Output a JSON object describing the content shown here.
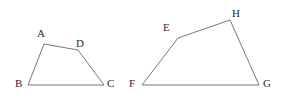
{
  "figure": {
    "background_color": "#ffffff",
    "stroke_color": "#555555",
    "label_color": "#2b2b2b",
    "stroke_width": 0.8,
    "width": 286,
    "height": 104,
    "shapes": [
      {
        "name": "quadrilateral-abcd",
        "vertex_order": "A-D-C-B",
        "closed": true,
        "points": [
          {
            "label": "A",
            "x": 44,
            "y": 44,
            "label_x": 37,
            "label_y": 28
          },
          {
            "label": "D",
            "x": 78,
            "y": 50,
            "label_x": 76,
            "label_y": 38
          },
          {
            "label": "C",
            "x": 104,
            "y": 85,
            "label_x": 107,
            "label_y": 78
          },
          {
            "label": "B",
            "x": 28,
            "y": 85,
            "label_x": 15,
            "label_y": 78
          }
        ]
      },
      {
        "name": "quadrilateral-efgh",
        "vertex_order": "E-H-G-F",
        "closed": true,
        "points": [
          {
            "label": "E",
            "x": 178,
            "y": 38,
            "label_x": 163,
            "label_y": 22
          },
          {
            "label": "H",
            "x": 230,
            "y": 20,
            "label_x": 232,
            "label_y": 8
          },
          {
            "label": "G",
            "x": 259,
            "y": 85,
            "label_x": 263,
            "label_y": 78
          },
          {
            "label": "F",
            "x": 142,
            "y": 85,
            "label_x": 129,
            "label_y": 78
          }
        ]
      }
    ]
  },
  "chart_data": {
    "type": "diagram",
    "title": "",
    "figures": [
      {
        "name": "ABCD",
        "vertices": [
          {
            "label": "A",
            "x": 44,
            "y": 44
          },
          {
            "label": "D",
            "x": 78,
            "y": 50
          },
          {
            "label": "C",
            "x": 104,
            "y": 85
          },
          {
            "label": "B",
            "x": 28,
            "y": 85
          }
        ],
        "edges": [
          "A-D",
          "D-C",
          "C-B",
          "B-A"
        ]
      },
      {
        "name": "EFGH",
        "vertices": [
          {
            "label": "E",
            "x": 178,
            "y": 38
          },
          {
            "label": "H",
            "x": 230,
            "y": 20
          },
          {
            "label": "G",
            "x": 259,
            "y": 85
          },
          {
            "label": "F",
            "x": 142,
            "y": 85
          }
        ],
        "edges": [
          "E-H",
          "H-G",
          "G-F",
          "F-E"
        ]
      }
    ]
  }
}
